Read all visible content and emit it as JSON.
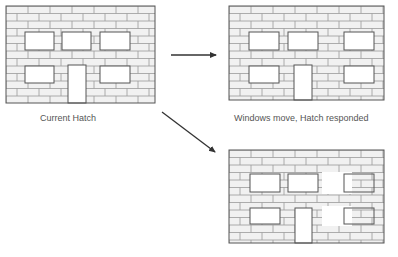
{
  "diagram": {
    "colors": {
      "wall_fill": "#f1f1f1",
      "brick_line": "#9a9a9a",
      "outline": "#555555",
      "opening_fill": "#ffffff",
      "arrow": "#333333",
      "caption": "#555555"
    },
    "panels": [
      {
        "id": "current",
        "caption": "Current Hatch",
        "windows_layout": "original"
      },
      {
        "id": "responded",
        "caption": "Windows move, Hatch responded",
        "windows_layout": "right-column moved right, hatch fills old openings"
      },
      {
        "id": "not-responded",
        "caption": "",
        "windows_layout": "right-column moved right, old openings left blank, hatch drawn through new openings"
      }
    ],
    "arrows": [
      {
        "from": "current",
        "to": "responded",
        "direction": "right"
      },
      {
        "from": "current",
        "to": "not-responded",
        "direction": "down-right"
      }
    ]
  }
}
